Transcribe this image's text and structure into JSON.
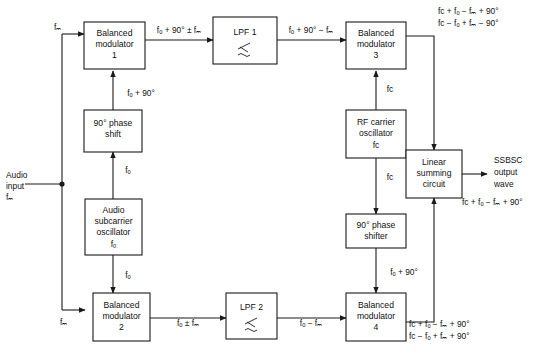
{
  "diagram": {
    "type": "block-diagram",
    "line_color": "#1a1a1a",
    "background": "#ffffff",
    "blocks": [
      {
        "id": "bm1",
        "lines": [
          "Balanced",
          "modulator",
          "1"
        ]
      },
      {
        "id": "lpf1",
        "lines": [
          "LPF 1"
        ],
        "symbol": "lowpass-filter-symbol"
      },
      {
        "id": "bm3",
        "lines": [
          "Balanced",
          "modulator",
          "3"
        ]
      },
      {
        "id": "phase_shift_90",
        "lines": [
          "90° phase",
          "shift"
        ]
      },
      {
        "id": "audio_osc",
        "lines": [
          "Audio",
          "subcarrier",
          "oscillator",
          "fₒ"
        ]
      },
      {
        "id": "rf_osc",
        "lines": [
          "RF carrier",
          "oscillator",
          "fᴄ"
        ]
      },
      {
        "id": "summing",
        "lines": [
          "Linear",
          "summing",
          "circuit"
        ]
      },
      {
        "id": "phase_shifter_90",
        "lines": [
          "90° phase",
          "shifter"
        ]
      },
      {
        "id": "bm2",
        "lines": [
          "Balanced",
          "modulator",
          "2"
        ]
      },
      {
        "id": "lpf2",
        "lines": [
          "LPF 2"
        ],
        "symbol": "lowpass-filter-symbol"
      },
      {
        "id": "bm4",
        "lines": [
          "Balanced",
          "modulator",
          "4"
        ]
      }
    ],
    "labels": {
      "audio_input": [
        "Audio",
        "input",
        "fₘ"
      ],
      "fm_top": "fₘ",
      "fm_bottom": "fₘ",
      "fo_to_phase_shift": "fₒ",
      "fo_to_bm2": "fₒ",
      "fo_plus_90_top": "fₒ + 90°",
      "bm1_out": "fₒ + 90° ± fₘ",
      "lpf1_out": "fₒ + 90° − fₘ",
      "bm3_out_line1": "fᴄ + fₒ − fₘ + 90°",
      "bm3_out_line2": "fᴄ − fₒ + fₘ − 90°",
      "fc_to_bm3": "fᴄ",
      "fc_to_phase_shifter": "fᴄ",
      "fo_plus_90_bottom": "fₒ + 90°",
      "bm2_out": "fₒ ± fₘ",
      "lpf2_out": "fₒ − fₘ",
      "bm4_out_line1": "fᴄ + fₒ − fₘ + 90°",
      "bm4_out_line2": "fᴄ − fₒ + fₘ + 90°",
      "output_title": [
        "SSBSC",
        "output",
        "wave"
      ],
      "output_expr": "fᴄ + fₒ − fₘ + 90°"
    }
  }
}
